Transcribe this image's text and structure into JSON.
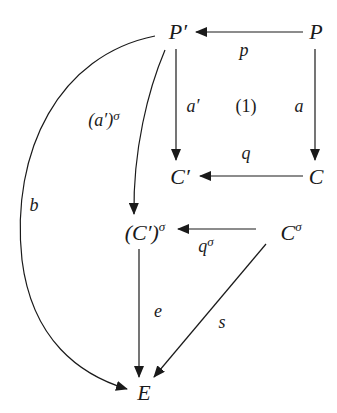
{
  "diagram": {
    "type": "commutative-diagram",
    "nodes": [
      {
        "id": "P_prime",
        "label": "P′",
        "x": 178,
        "y": 32
      },
      {
        "id": "P",
        "label": "P",
        "x": 316,
        "y": 32
      },
      {
        "id": "C_prime",
        "label": "C′",
        "x": 180,
        "y": 177
      },
      {
        "id": "C",
        "label": "C",
        "x": 316,
        "y": 177
      },
      {
        "id": "C_prime_sigma",
        "label": "(C′)",
        "sup": "σ",
        "x": 145,
        "y": 233
      },
      {
        "id": "C_sigma",
        "label": "C",
        "sup": "σ",
        "x": 291,
        "y": 233
      },
      {
        "id": "E",
        "label": "E",
        "x": 144,
        "y": 393
      }
    ],
    "edges": [
      {
        "from": "P",
        "to": "P_prime",
        "label": "p",
        "label_x": 244,
        "label_y": 50
      },
      {
        "from": "P_prime",
        "to": "C_prime",
        "label": "a′",
        "label_x": 193,
        "label_y": 106
      },
      {
        "from": "P",
        "to": "C",
        "label": "a",
        "label_x": 299,
        "label_y": 106
      },
      {
        "from": "C",
        "to": "C_prime",
        "label": "q",
        "label_x": 246,
        "label_y": 153
      },
      {
        "from": "P_prime",
        "to": "C_prime_sigma",
        "label": "(a′)",
        "label_sup": "σ",
        "label_x": 104,
        "label_y": 120
      },
      {
        "from": "P_prime",
        "to": "E",
        "label": "b",
        "label_x": 34,
        "label_y": 205
      },
      {
        "from": "C_sigma",
        "to": "C_prime_sigma",
        "label": "q",
        "label_sup": "σ",
        "label_x": 206,
        "label_y": 246
      },
      {
        "from": "C_prime_sigma",
        "to": "E",
        "label": "e",
        "label_x": 158,
        "label_y": 311
      },
      {
        "from": "C_sigma",
        "to": "E",
        "label": "s",
        "label_x": 222,
        "label_y": 322
      }
    ],
    "region_label": {
      "text": "(1)",
      "x": 246,
      "y": 106
    }
  }
}
